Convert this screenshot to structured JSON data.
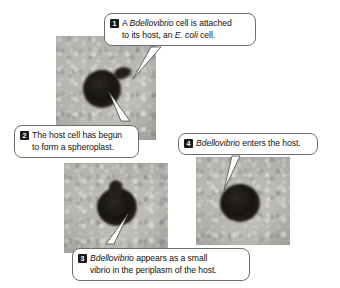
{
  "figure": {
    "background_color": "#ffffff",
    "badge_color": "#1a1a1a",
    "badge_text_color": "#ffffff",
    "callout_border_color": "#6d6d6d",
    "micrograph_color": "#b9b7b2",
    "cell_color": "#17150f"
  },
  "callouts": [
    {
      "number": "1",
      "line1_pre": "A ",
      "line1_italic": "Bdellovibrio",
      "line1_post": " cell is attached",
      "line2_pre": "to its host, an ",
      "line2_italic": "E. coli",
      "line2_post": " cell."
    },
    {
      "number": "2",
      "line1_pre": "The host cell has begun",
      "line1_italic": "",
      "line1_post": "",
      "line2_pre": "to form a spheroplast.",
      "line2_italic": "",
      "line2_post": ""
    },
    {
      "number": "3",
      "line1_pre": "",
      "line1_italic": "Bdellovibrio",
      "line1_post": " appears as a small",
      "line2_pre": "vibrio in the periplasm of the host.",
      "line2_italic": "",
      "line2_post": ""
    },
    {
      "number": "4",
      "line1_pre": "",
      "line1_italic": "Bdellovibrio",
      "line1_post": " enters the host.",
      "line2_pre": "",
      "line2_italic": "",
      "line2_post": ""
    }
  ],
  "panels": [
    {
      "name": "panel-attachment",
      "caption_refs": [
        "1",
        "2"
      ]
    },
    {
      "name": "panel-periplasm",
      "caption_refs": [
        "3"
      ]
    },
    {
      "name": "panel-entry",
      "caption_refs": [
        "4"
      ]
    }
  ]
}
